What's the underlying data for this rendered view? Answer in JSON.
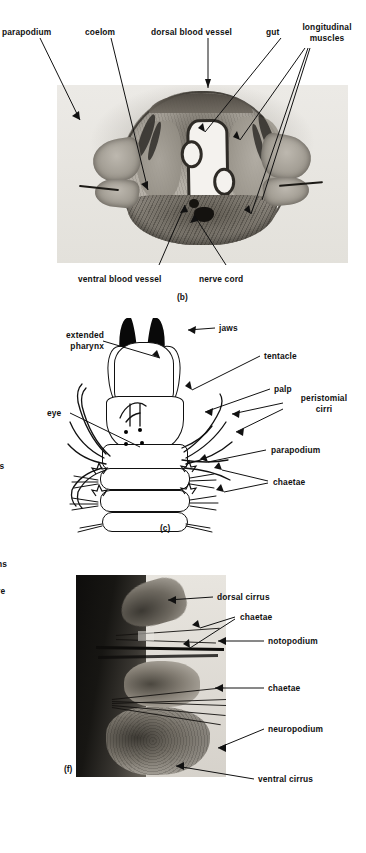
{
  "figure": {
    "panels": [
      {
        "id": "(b)",
        "kind": "photomicrograph",
        "description": "transverse section through the body of a polychaete worm",
        "labels_top": [
          {
            "text": "parapodium",
            "align": "left"
          },
          {
            "text": "coelom",
            "align": "center"
          },
          {
            "text": "dorsal blood vessel",
            "align": "center"
          },
          {
            "text": "gut",
            "align": "center"
          },
          {
            "text": "longitudinal\nmuscles",
            "align": "center"
          }
        ],
        "labels_bottom": [
          {
            "text": "ventral blood vessel",
            "align": "center"
          },
          {
            "text": "nerve cord",
            "align": "center"
          }
        ]
      },
      {
        "id": "(c)",
        "kind": "line drawing",
        "description": "dorsal view of the head with the pharynx everted",
        "labels": [
          {
            "text": "extended\npharynx",
            "align": "right"
          },
          {
            "text": "jaws",
            "align": "left"
          },
          {
            "text": "tentacle",
            "align": "left"
          },
          {
            "text": "eye",
            "align": "right"
          },
          {
            "text": "palp",
            "align": "left"
          },
          {
            "text": "peristomial\ncirri",
            "align": "center"
          },
          {
            "text": "parapodium",
            "align": "left"
          },
          {
            "text": "chaetae",
            "align": "left"
          }
        ]
      },
      {
        "id": "(f)",
        "kind": "photomicrograph",
        "description": "parapodium showing notopodium and neuropodium",
        "labels": [
          {
            "text": "dorsal cirrus",
            "align": "left"
          },
          {
            "text": "chaetae",
            "align": "left"
          },
          {
            "text": "notopodium",
            "align": "left"
          },
          {
            "text": "chaetae",
            "align": "left"
          },
          {
            "text": "neuropodium",
            "align": "left"
          },
          {
            "text": "ventral cirrus",
            "align": "left"
          }
        ]
      }
    ],
    "clipped_margin_fragments": [
      {
        "text": "is"
      },
      {
        "text": "ns"
      },
      {
        "text": "re"
      }
    ]
  }
}
